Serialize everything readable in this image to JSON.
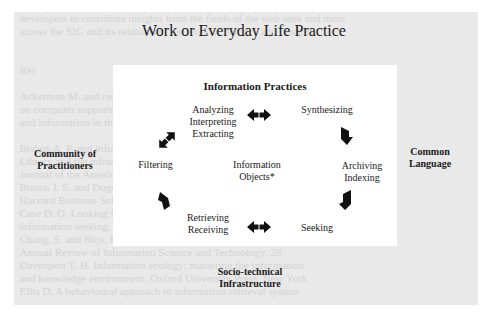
{
  "diagram": {
    "outer_title": "Work or Everyday Life Practice",
    "inner_title": "Information Practices",
    "center": {
      "line1": "Information",
      "line2": "Objects*"
    },
    "nodes": {
      "analyzing": {
        "line1": "Analyzing",
        "line2": "Interpreting",
        "line3": "Extracting"
      },
      "synthesizing": {
        "line1": "Synthesizing"
      },
      "archiving": {
        "line1": "Archiving",
        "line2": "Indexing"
      },
      "seeking": {
        "line1": "Seeking"
      },
      "retrieving": {
        "line1": "Retrieving",
        "line2": "Receiving"
      },
      "filtering": {
        "line1": "Filtering"
      }
    },
    "context_labels": {
      "left": {
        "line1": "Community of",
        "line2": "Practitioners"
      },
      "right": {
        "line1": "Common",
        "line2": "Language"
      },
      "bottom": {
        "line1": "Socio-technical",
        "line2": "Infrastructure"
      }
    },
    "arrows": [
      {
        "from": "analyzing",
        "to": "synthesizing",
        "type": "bidirectional"
      },
      {
        "from": "synthesizing",
        "to": "archiving",
        "type": "unidirectional"
      },
      {
        "from": "archiving",
        "to": "seeking",
        "type": "unidirectional"
      },
      {
        "from": "seeking",
        "to": "retrieving",
        "type": "bidirectional"
      },
      {
        "from": "retrieving",
        "to": "filtering",
        "type": "unidirectional"
      },
      {
        "from": "filtering",
        "to": "analyzing",
        "type": "bidirectional"
      }
    ],
    "colors": {
      "outer_background": "#e9e9e9",
      "inner_background": "#ffffff",
      "text": "#1a1a1a",
      "arrow": "#111111"
    }
  }
}
